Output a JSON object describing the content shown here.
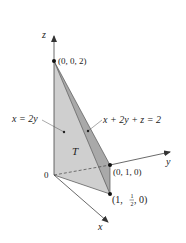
{
  "figure": {
    "axes": {
      "z_label": "z",
      "y_label": "y",
      "x_label": "x",
      "origin_label": "0"
    },
    "points": {
      "p_z": "(0, 0, 2)",
      "p_y": "(0, 1, 0)",
      "p_x_prefix": "(1, ",
      "p_x_frac_num": "1",
      "p_x_frac_den": "2",
      "p_x_suffix": ", 0)"
    },
    "annotations": {
      "plane_left": "x = 2y",
      "plane_right": "x + 2y + z = 2",
      "region": "T"
    },
    "colors": {
      "face_light": "#cfcfcf",
      "face_mid": "#bdbdbd",
      "face_dark": "#a6a6a6",
      "axis": "#444444"
    }
  }
}
